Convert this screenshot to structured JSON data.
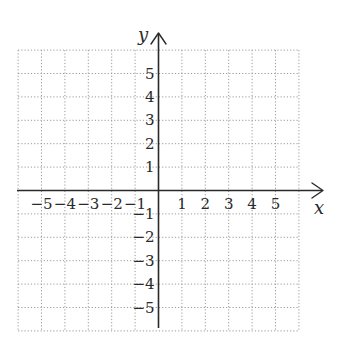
{
  "diagram": {
    "type": "coordinate-plane",
    "x_axis_label": "x",
    "y_axis_label": "y",
    "x_range": [
      -6,
      6
    ],
    "y_range": [
      -6,
      6
    ],
    "grid": "dotted",
    "x_tick_labels": [
      {
        "value": -5,
        "text": "−5"
      },
      {
        "value": -4,
        "text": "−4"
      },
      {
        "value": -3,
        "text": "−3"
      },
      {
        "value": -2,
        "text": "−2"
      },
      {
        "value": -1,
        "text": "−1"
      },
      {
        "value": 1,
        "text": "1"
      },
      {
        "value": 2,
        "text": "2"
      },
      {
        "value": 3,
        "text": "3"
      },
      {
        "value": 4,
        "text": "4"
      },
      {
        "value": 5,
        "text": "5"
      }
    ],
    "y_tick_labels": [
      {
        "value": 5,
        "text": "5"
      },
      {
        "value": 4,
        "text": "4"
      },
      {
        "value": 3,
        "text": "3"
      },
      {
        "value": 2,
        "text": "2"
      },
      {
        "value": 1,
        "text": "1"
      },
      {
        "value": -1,
        "text": "−1"
      },
      {
        "value": -2,
        "text": "−2"
      },
      {
        "value": -3,
        "text": "−3"
      },
      {
        "value": -4,
        "text": "−4"
      },
      {
        "value": -5,
        "text": "−5"
      }
    ],
    "colors": {
      "axis": "#2a2a2a",
      "grid": "#9a9a9a",
      "text": "#2a2a2a"
    }
  }
}
